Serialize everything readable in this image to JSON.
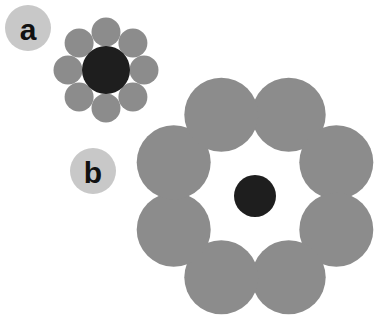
{
  "figure": {
    "width": 383,
    "height": 327,
    "background_color": "#ffffff"
  },
  "colors": {
    "shell_gray": "#8c8c8c",
    "core_dark": "#1e1e1e",
    "label_badge_gray": "#c8c8c8",
    "label_text": "#111111",
    "background": "#ffffff"
  },
  "labels": [
    {
      "id": "panel-label-a",
      "text": "a",
      "cx": 28,
      "cy": 28,
      "r": 23,
      "font_size": 30
    },
    {
      "id": "panel-label-b",
      "text": "b",
      "cx": 93,
      "cy": 171,
      "r": 23,
      "font_size": 30
    }
  ],
  "clusters": [
    {
      "id": "cluster-a",
      "label": "a",
      "center": {
        "x": 106,
        "y": 70
      },
      "core": {
        "r": 24,
        "color": "#1e1e1e"
      },
      "shell": {
        "count": 8,
        "r": 14.5,
        "orbit_radius": 38,
        "start_angle_deg": -90,
        "color": "#8c8c8c"
      },
      "satellites": [
        {
          "i": 1,
          "cx": 106.0,
          "cy": 32.0
        },
        {
          "i": 2,
          "cx": 132.9,
          "cy": 43.1
        },
        {
          "i": 3,
          "cx": 144.0,
          "cy": 70.0
        },
        {
          "i": 4,
          "cx": 132.9,
          "cy": 96.9
        },
        {
          "i": 5,
          "cx": 106.0,
          "cy": 108.0
        },
        {
          "i": 6,
          "cx": 79.1,
          "cy": 96.9
        },
        {
          "i": 7,
          "cx": 68.0,
          "cy": 70.0
        },
        {
          "i": 8,
          "cx": 79.1,
          "cy": 43.1
        }
      ]
    },
    {
      "id": "cluster-b",
      "label": "b",
      "center": {
        "x": 255,
        "y": 196
      },
      "core": {
        "r": 21,
        "color": "#1e1e1e"
      },
      "shell": {
        "count": 8,
        "r": 37,
        "orbit_radius": 88,
        "start_angle_deg": -67.5,
        "color": "#8c8c8c"
      },
      "satellites": [
        {
          "i": 1,
          "cx": 288.7,
          "cy": 114.7
        },
        {
          "i": 2,
          "cx": 336.3,
          "cy": 162.3
        },
        {
          "i": 3,
          "cx": 336.3,
          "cy": 229.7
        },
        {
          "i": 4,
          "cx": 288.7,
          "cy": 277.3
        },
        {
          "i": 5,
          "cx": 221.3,
          "cy": 277.3
        },
        {
          "i": 6,
          "cx": 173.7,
          "cy": 229.7
        },
        {
          "i": 7,
          "cx": 173.7,
          "cy": 162.3
        },
        {
          "i": 8,
          "cx": 221.3,
          "cy": 114.7
        }
      ]
    }
  ]
}
